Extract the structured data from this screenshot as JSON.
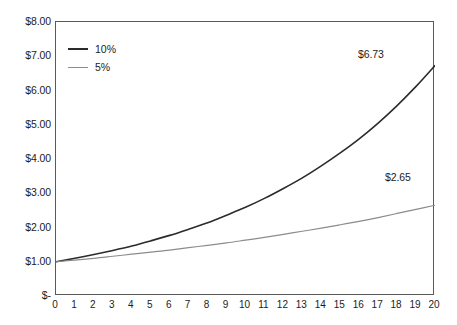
{
  "chart_data": {
    "type": "line",
    "title": "",
    "subtitle": "",
    "xlabel": "",
    "ylabel": "",
    "xlim": [
      0,
      20
    ],
    "ylim": [
      0,
      8
    ],
    "grid": false,
    "legend_position": "top-left",
    "x": [
      0,
      1,
      2,
      3,
      4,
      5,
      6,
      7,
      8,
      9,
      10,
      11,
      12,
      13,
      14,
      15,
      16,
      17,
      18,
      19,
      20
    ],
    "xtick_labels": [
      "0",
      "1",
      "2",
      "3",
      "4",
      "5",
      "6",
      "7",
      "8",
      "9",
      "10",
      "11",
      "12",
      "13",
      "14",
      "15",
      "16",
      "17",
      "18",
      "19",
      "20"
    ],
    "ytick_values": [
      8,
      7,
      6,
      5,
      4,
      3,
      2,
      1,
      0
    ],
    "ytick_labels": [
      "$8.00",
      "$7.00",
      "$6.00",
      "$5.00",
      "$4.00",
      "$3.00",
      "$2.00",
      "$1.00",
      "$-"
    ],
    "series": [
      {
        "name": "10%",
        "color": "#2b2b2b",
        "width": 1.6,
        "values": [
          1.0,
          1.1,
          1.21,
          1.33,
          1.46,
          1.61,
          1.77,
          1.95,
          2.14,
          2.36,
          2.59,
          2.85,
          3.14,
          3.45,
          3.8,
          4.18,
          4.59,
          5.05,
          5.56,
          6.12,
          6.73
        ],
        "end_label": "$6.73"
      },
      {
        "name": "5%",
        "color": "#8c8c8c",
        "width": 1.2,
        "values": [
          1.0,
          1.05,
          1.1,
          1.16,
          1.22,
          1.28,
          1.34,
          1.41,
          1.48,
          1.55,
          1.63,
          1.71,
          1.8,
          1.89,
          1.98,
          2.08,
          2.18,
          2.29,
          2.41,
          2.53,
          2.65
        ],
        "end_label": "$2.65"
      }
    ],
    "annotations": [
      {
        "text": "$6.73",
        "series": "10%",
        "x": 20,
        "y": 6.73
      },
      {
        "text": "$2.65",
        "series": "5%",
        "x": 20,
        "y": 2.65
      }
    ]
  },
  "legend": {
    "items": [
      {
        "label": "10%"
      },
      {
        "label": "5%"
      }
    ]
  },
  "colors": {
    "series_10": "#2b2b2b",
    "series_5": "#8c8c8c",
    "axis": "#5a5a5a",
    "text": "#1c1c1c",
    "background": "#ffffff"
  }
}
